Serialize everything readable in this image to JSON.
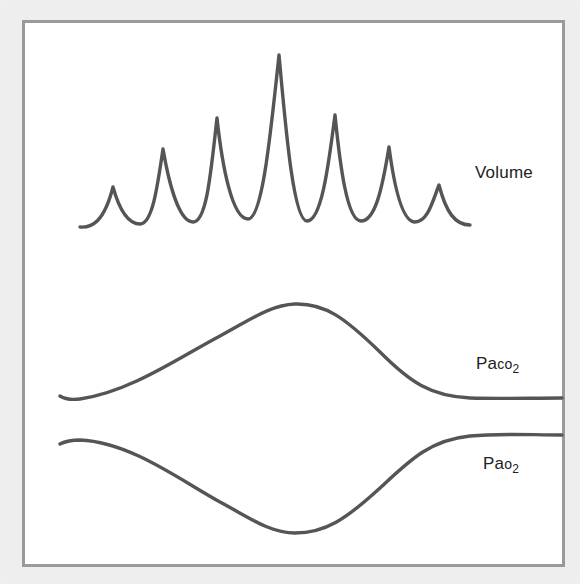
{
  "diagram": {
    "colors": {
      "background": "#eeeeee",
      "panel": "#ffffff",
      "border": "#9a9a9a",
      "trace": "#555555",
      "text": "#222222"
    },
    "traces": [
      {
        "id": "volume",
        "label": "Volume",
        "description": "Waxing and waning tidal volume spikes (7 breaths, largest in middle)",
        "peaks_relative_height": [
          0.24,
          0.46,
          0.63,
          1.0,
          0.65,
          0.47,
          0.24
        ]
      },
      {
        "id": "paco2",
        "label_main": "Pa",
        "label_small": "co",
        "label_sub": "2",
        "description": "Arterial CO2 rises to a maximum then falls to a plateau"
      },
      {
        "id": "pao2",
        "label_main": "Pa",
        "label_small": "o",
        "label_sub": "2",
        "description": "Arterial O2 falls to a minimum then rises to a plateau"
      }
    ]
  }
}
